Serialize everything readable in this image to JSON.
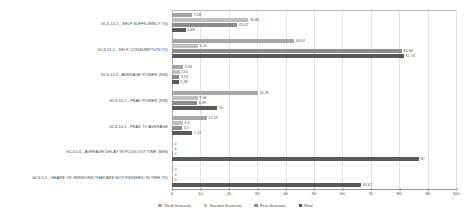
{
  "chart_data": {
    "type": "bar",
    "orientation": "horizontal",
    "title": "",
    "xlabel": "",
    "ylabel": "",
    "xlim": [
      0,
      100
    ],
    "xticks": [
      0,
      10,
      20,
      30,
      40,
      50,
      60,
      70,
      80,
      90,
      100
    ],
    "grid": true,
    "legend_position": "bottom",
    "categories": [
      "GC3.14.2 - SELF SUFFICIENCY (%)",
      "GC3.14.1 - SELF CONSUMPTION (%)",
      "GC3.10.3 - AVERAGE POWER (KW)",
      "GC3.10.2 - PEAK POWER (KW)",
      "GC3.10.1 - PEAK TO AVERAGE",
      "GC3.5.6 - AVERAGE DELAY IN PLUG-OUT TIME (MIN)",
      "GC3.5.5 - SHARE OF SESSIONS THAT ARE NOT FINISHED IN TIME (%)"
    ],
    "series": [
      {
        "name": "Third Scenario",
        "color": "#a6a6a6",
        "values": [
          7.08,
          43.07,
          3.94,
          30.26,
          12.29,
          0,
          0
        ],
        "labels": [
          "7,08",
          "43,07",
          "3,94",
          "30,26",
          "12,29",
          "0",
          "0"
        ]
      },
      {
        "name": "Second Scenario",
        "color": "#bfbfbf",
        "values": [
          26.84,
          9.15,
          2.65,
          9.06,
          3.8,
          0,
          0
        ],
        "labels": [
          "26,84",
          "9,15",
          "2,65",
          "9,06",
          "3,8",
          "0",
          "0"
        ]
      },
      {
        "name": "First Scenario",
        "color": "#8c8c8c",
        "values": [
          23.02,
          80.94,
          2.53,
          8.89,
          3.5,
          0,
          0
        ],
        "labels": [
          "23,02",
          "80,94",
          "2,53",
          "8,89",
          "3,5",
          "0",
          "0"
        ]
      },
      {
        "name": "Real",
        "color": "#595959",
        "values": [
          4.88,
          81.73,
          2.38,
          16,
          7.14,
          87,
          66.67
        ],
        "labels": [
          "4,88",
          "81,73",
          "2,38",
          "16",
          "7,14",
          "87",
          "66,67"
        ]
      }
    ]
  }
}
